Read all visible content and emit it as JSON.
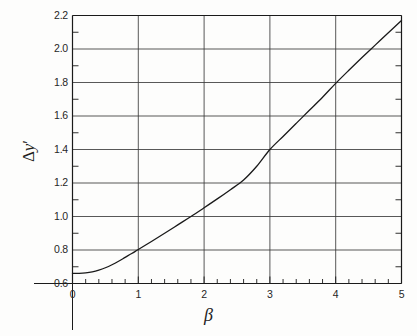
{
  "figure": {
    "background_color": "#fdfdfc",
    "line_color": "#1a1a1a",
    "grid_color": "#3a3a3a",
    "axis_color": "#1a1a1a"
  },
  "axes": {
    "x_title": "β",
    "y_title_delta": "Δ",
    "y_title_var": "y",
    "y_title_prime": "′",
    "y_title_full": "Δy′"
  },
  "chart_data": {
    "type": "line",
    "title": "",
    "xlabel": "β",
    "ylabel": "Δy′",
    "xlim": [
      0,
      5
    ],
    "ylim": [
      0.6,
      2.2
    ],
    "grid": true,
    "legend": null,
    "x_ticks": [
      0,
      1,
      2,
      3,
      4,
      5
    ],
    "x_tick_labels": [
      "0",
      "1",
      "2",
      "3",
      "4",
      "5"
    ],
    "x_minor_tick_step": 0.2,
    "y_ticks": [
      0.6,
      0.8,
      1.0,
      1.2,
      1.4,
      1.6,
      1.8,
      2.0,
      2.2
    ],
    "y_tick_labels": [
      "0.6",
      "0.8",
      "1.0",
      "1.2",
      "1.4",
      "1.6",
      "1.8",
      "2.0",
      "2.2"
    ],
    "y_minor_tick_step": 0.1,
    "series": [
      {
        "name": "Δy′ vs β",
        "x": [
          0.0,
          0.1,
          0.2,
          0.3,
          0.4,
          0.5,
          0.6,
          0.7,
          0.8,
          0.9,
          1.0,
          1.2,
          1.4,
          1.6,
          1.8,
          2.0,
          2.2,
          2.4,
          2.6,
          2.8,
          3.0,
          3.2,
          3.4,
          3.6,
          3.8,
          4.0,
          4.2,
          4.4,
          4.6,
          4.8,
          5.0
        ],
        "y": [
          0.66,
          0.661,
          0.664,
          0.67,
          0.68,
          0.694,
          0.712,
          0.733,
          0.756,
          0.779,
          0.803,
          0.851,
          0.9,
          0.95,
          1.0,
          1.052,
          1.105,
          1.16,
          1.218,
          1.3,
          1.4,
          1.478,
          1.556,
          1.634,
          1.712,
          1.795,
          1.873,
          1.949,
          2.023,
          2.097,
          2.17
        ]
      }
    ]
  }
}
